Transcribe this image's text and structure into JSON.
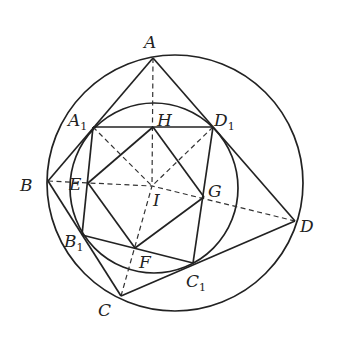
{
  "figure": {
    "colors": {
      "stroke": "#222222",
      "background": "#ffffff"
    },
    "outer_circle": {
      "cx": 175,
      "cy": 183,
      "r": 128
    },
    "inner_circle": {
      "cx": 154,
      "cy": 188,
      "rx": 84,
      "ry": 85
    },
    "points": {
      "A": {
        "x": 153,
        "y": 58
      },
      "B": {
        "x": 48,
        "y": 181
      },
      "C": {
        "x": 121,
        "y": 296
      },
      "D": {
        "x": 295,
        "y": 221
      },
      "A1": {
        "x": 93,
        "y": 127
      },
      "B1": {
        "x": 82,
        "y": 235
      },
      "C1": {
        "x": 193,
        "y": 263
      },
      "D1": {
        "x": 213,
        "y": 127
      },
      "E": {
        "x": 88,
        "y": 183
      },
      "F": {
        "x": 135,
        "y": 248
      },
      "G": {
        "x": 204,
        "y": 197
      },
      "H": {
        "x": 153,
        "y": 127
      },
      "I": {
        "x": 152,
        "y": 186
      }
    },
    "labels": {
      "A": {
        "main": "A",
        "sub": "",
        "x": 144,
        "y": 48
      },
      "B": {
        "main": "B",
        "sub": "",
        "x": 20,
        "y": 191
      },
      "C": {
        "main": "C",
        "sub": "",
        "x": 98,
        "y": 316
      },
      "D": {
        "main": "D",
        "sub": "",
        "x": 300,
        "y": 232
      },
      "A1": {
        "main": "A",
        "sub": "1",
        "x": 68,
        "y": 126
      },
      "B1": {
        "main": "B",
        "sub": "1",
        "x": 64,
        "y": 247
      },
      "C1": {
        "main": "C",
        "sub": "1",
        "x": 186,
        "y": 287
      },
      "D1": {
        "main": "D",
        "sub": "1",
        "x": 214,
        "y": 126
      },
      "E": {
        "main": "E",
        "sub": "",
        "x": 69,
        "y": 190
      },
      "F": {
        "main": "F",
        "sub": "",
        "x": 139,
        "y": 268
      },
      "G": {
        "main": "G",
        "sub": "",
        "x": 208,
        "y": 197
      },
      "H": {
        "main": "H",
        "sub": "",
        "x": 157,
        "y": 126
      },
      "I": {
        "main": "I",
        "sub": "",
        "x": 153,
        "y": 206
      }
    },
    "solid_segments": [
      [
        "A",
        "B"
      ],
      [
        "B",
        "C"
      ],
      [
        "C",
        "D"
      ],
      [
        "D",
        "A"
      ],
      [
        "A1",
        "B1"
      ],
      [
        "B1",
        "C1"
      ],
      [
        "C1",
        "D1"
      ],
      [
        "D1",
        "A1"
      ],
      [
        "E",
        "F"
      ],
      [
        "F",
        "G"
      ],
      [
        "G",
        "H"
      ],
      [
        "H",
        "E"
      ]
    ],
    "dashed_segments": [
      [
        "A",
        "I"
      ],
      [
        "B",
        "I"
      ],
      [
        "C",
        "I"
      ],
      [
        "D",
        "I"
      ],
      [
        "A1",
        "I"
      ],
      [
        "D1",
        "I"
      ]
    ]
  }
}
